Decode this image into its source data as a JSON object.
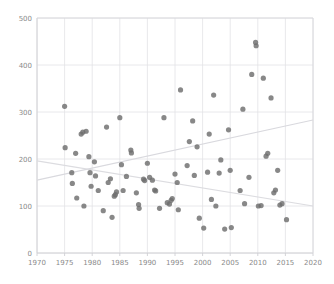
{
  "chart_data": {
    "type": "scatter",
    "title": "",
    "xlabel": "",
    "ylabel": "",
    "xlim": [
      1970,
      2020
    ],
    "ylim": [
      0,
      500
    ],
    "grid": true,
    "legend": "none",
    "xticks": [
      1970,
      1975,
      1980,
      1985,
      1990,
      1995,
      2000,
      2005,
      2010,
      2015,
      2020
    ],
    "yticks": [
      0,
      100,
      200,
      300,
      400,
      500
    ],
    "xtick_labels": [
      "1970",
      "1975",
      "1980",
      "1985",
      "1990",
      "1995",
      "2000",
      "2005",
      "2010",
      "2015",
      "2020"
    ],
    "ytick_labels": [
      "0",
      "100",
      "200",
      "300",
      "400",
      "500"
    ],
    "marker": {
      "shape": "circle",
      "color": "#6e6e6e",
      "opacity": 0.82,
      "size_px": 5.2
    },
    "points": [
      {
        "x": 1975.0,
        "y": 312
      },
      {
        "x": 1975.1,
        "y": 224
      },
      {
        "x": 1976.3,
        "y": 171
      },
      {
        "x": 1976.4,
        "y": 148
      },
      {
        "x": 1977.0,
        "y": 212
      },
      {
        "x": 1977.2,
        "y": 117
      },
      {
        "x": 1978.0,
        "y": 253
      },
      {
        "x": 1978.3,
        "y": 257
      },
      {
        "x": 1978.5,
        "y": 100
      },
      {
        "x": 1978.9,
        "y": 259
      },
      {
        "x": 1979.4,
        "y": 205
      },
      {
        "x": 1979.6,
        "y": 171
      },
      {
        "x": 1979.8,
        "y": 142
      },
      {
        "x": 1980.4,
        "y": 194
      },
      {
        "x": 1980.6,
        "y": 164
      },
      {
        "x": 1981.1,
        "y": 133
      },
      {
        "x": 1982.0,
        "y": 90
      },
      {
        "x": 1982.6,
        "y": 268
      },
      {
        "x": 1982.9,
        "y": 150
      },
      {
        "x": 1983.3,
        "y": 158
      },
      {
        "x": 1983.6,
        "y": 76
      },
      {
        "x": 1984.0,
        "y": 121
      },
      {
        "x": 1984.2,
        "y": 124
      },
      {
        "x": 1984.4,
        "y": 130
      },
      {
        "x": 1985.0,
        "y": 288
      },
      {
        "x": 1985.3,
        "y": 188
      },
      {
        "x": 1985.6,
        "y": 133
      },
      {
        "x": 1986.2,
        "y": 163
      },
      {
        "x": 1987.0,
        "y": 219
      },
      {
        "x": 1987.1,
        "y": 213
      },
      {
        "x": 1988.0,
        "y": 128
      },
      {
        "x": 1988.4,
        "y": 103
      },
      {
        "x": 1988.5,
        "y": 95
      },
      {
        "x": 1989.3,
        "y": 157
      },
      {
        "x": 1989.5,
        "y": 154
      },
      {
        "x": 1990.0,
        "y": 191
      },
      {
        "x": 1990.4,
        "y": 161
      },
      {
        "x": 1990.9,
        "y": 155
      },
      {
        "x": 1991.3,
        "y": 134
      },
      {
        "x": 1991.5,
        "y": 132
      },
      {
        "x": 1992.2,
        "y": 95
      },
      {
        "x": 1993.0,
        "y": 288
      },
      {
        "x": 1993.6,
        "y": 107
      },
      {
        "x": 1994.0,
        "y": 104
      },
      {
        "x": 1994.3,
        "y": 112
      },
      {
        "x": 1994.5,
        "y": 116
      },
      {
        "x": 1995.0,
        "y": 168
      },
      {
        "x": 1995.4,
        "y": 150
      },
      {
        "x": 1995.6,
        "y": 92
      },
      {
        "x": 1996.0,
        "y": 347
      },
      {
        "x": 1997.2,
        "y": 186
      },
      {
        "x": 1997.6,
        "y": 237
      },
      {
        "x": 1998.2,
        "y": 281
      },
      {
        "x": 1998.5,
        "y": 165
      },
      {
        "x": 1999.0,
        "y": 226
      },
      {
        "x": 1999.4,
        "y": 74
      },
      {
        "x": 2000.2,
        "y": 53
      },
      {
        "x": 2000.9,
        "y": 172
      },
      {
        "x": 2001.2,
        "y": 253
      },
      {
        "x": 2001.6,
        "y": 114
      },
      {
        "x": 2002.0,
        "y": 336
      },
      {
        "x": 2002.4,
        "y": 100
      },
      {
        "x": 2003.0,
        "y": 170
      },
      {
        "x": 2003.3,
        "y": 198
      },
      {
        "x": 2004.0,
        "y": 51
      },
      {
        "x": 2004.7,
        "y": 262
      },
      {
        "x": 2005.0,
        "y": 176
      },
      {
        "x": 2005.2,
        "y": 54
      },
      {
        "x": 2006.8,
        "y": 133
      },
      {
        "x": 2007.3,
        "y": 306
      },
      {
        "x": 2007.6,
        "y": 105
      },
      {
        "x": 2008.4,
        "y": 161
      },
      {
        "x": 2008.9,
        "y": 380
      },
      {
        "x": 2009.6,
        "y": 448
      },
      {
        "x": 2009.7,
        "y": 441
      },
      {
        "x": 2010.1,
        "y": 100
      },
      {
        "x": 2010.6,
        "y": 101
      },
      {
        "x": 2011.0,
        "y": 372
      },
      {
        "x": 2011.5,
        "y": 206
      },
      {
        "x": 2011.8,
        "y": 212
      },
      {
        "x": 2012.4,
        "y": 330
      },
      {
        "x": 2012.9,
        "y": 128
      },
      {
        "x": 2013.2,
        "y": 134
      },
      {
        "x": 2013.6,
        "y": 176
      },
      {
        "x": 2014.0,
        "y": 102
      },
      {
        "x": 2014.4,
        "y": 105
      },
      {
        "x": 2015.2,
        "y": 71
      }
    ],
    "trendlines": [
      {
        "name": "ascending-trend",
        "x0": 1970,
        "y0": 155,
        "x1": 2020,
        "y1": 283,
        "color": "#d9d9de"
      },
      {
        "name": "descending-trend",
        "x0": 1970,
        "y0": 196,
        "x1": 2020,
        "y1": 100,
        "color": "#dcdce0"
      }
    ]
  }
}
